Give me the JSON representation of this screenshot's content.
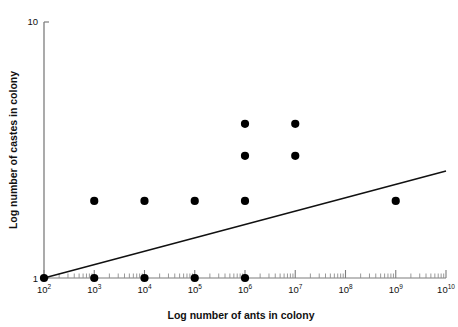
{
  "figure": {
    "background_color": "#ffffff",
    "ink_color": "#111111",
    "axis_color": "#7d7d7d",
    "marker_color": "#000000",
    "line_color": "#111111",
    "cropped_top_text": ""
  },
  "axes": {
    "x": {
      "title": "Log number of ants in colony",
      "tick_labels": [
        "10",
        "10",
        "10",
        "10",
        "10",
        "10",
        "10",
        "10",
        "10"
      ],
      "tick_exponents": [
        "2",
        "3",
        "4",
        "5",
        "6",
        "7",
        "8",
        "9",
        "10"
      ],
      "tick_values": [
        2,
        3,
        4,
        5,
        6,
        7,
        8,
        9,
        10
      ],
      "scale": "log",
      "minor_ticks": true,
      "range_exponents": [
        2,
        10
      ]
    },
    "y": {
      "title": "Log number of castes in colony",
      "tick_labels": [
        "10",
        "1"
      ],
      "tick_values": [
        10,
        1
      ],
      "scale": "log",
      "minor_ticks": false,
      "range": [
        1,
        10
      ]
    }
  },
  "chart_data": {
    "type": "scatter",
    "title": "",
    "xlabel": "Log number of ants in colony",
    "ylabel": "Log number of castes in colony",
    "xscale": "log",
    "yscale": "log",
    "xlim": [
      100,
      10000000000
    ],
    "ylim": [
      1,
      10
    ],
    "grid": false,
    "legend": "none",
    "marker": "filled-circle",
    "marker_color": "#000000",
    "points": [
      {
        "x": 100,
        "y": 1.0,
        "x_exponent": 2,
        "label": "1e2, 1 caste"
      },
      {
        "x": 1000,
        "y": 1.0,
        "x_exponent": 3,
        "label": "1e3, 1 caste"
      },
      {
        "x": 10000,
        "y": 1.0,
        "x_exponent": 4,
        "label": "1e4, 1 caste"
      },
      {
        "x": 100000,
        "y": 1.0,
        "x_exponent": 5,
        "label": "1e5, 1 caste"
      },
      {
        "x": 1000000,
        "y": 1.0,
        "x_exponent": 6,
        "label": "1e6, 1 caste"
      },
      {
        "x": 1000,
        "y": 2.0,
        "x_exponent": 3,
        "label": "1e3, 2 castes"
      },
      {
        "x": 10000,
        "y": 2.0,
        "x_exponent": 4,
        "label": "1e4, 2 castes"
      },
      {
        "x": 100000,
        "y": 2.0,
        "x_exponent": 5,
        "label": "1e5, 2 castes"
      },
      {
        "x": 1000000,
        "y": 2.0,
        "x_exponent": 6,
        "label": "1e6, 2 castes"
      },
      {
        "x": 1000000000,
        "y": 2.0,
        "x_exponent": 9,
        "label": "1e9, 2 castes"
      },
      {
        "x": 1000000,
        "y": 3.0,
        "x_exponent": 6,
        "label": "1e6, 3 castes"
      },
      {
        "x": 10000000,
        "y": 3.0,
        "x_exponent": 7,
        "label": "1e7, 3 castes"
      },
      {
        "x": 1000000,
        "y": 4.0,
        "x_exponent": 6,
        "label": "1e6, 4 castes"
      },
      {
        "x": 10000000,
        "y": 4.0,
        "x_exponent": 7,
        "label": "1e7, 4 castes"
      }
    ],
    "trend_line": {
      "type": "line",
      "start": {
        "x": 100,
        "y": 1.0
      },
      "end": {
        "x": 10000000000,
        "y": 2.62
      },
      "style": "solid"
    }
  }
}
